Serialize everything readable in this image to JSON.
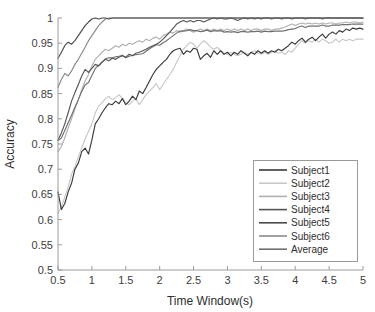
{
  "chart_data": {
    "type": "line",
    "title": "",
    "xlabel": "Time Window(s)",
    "ylabel": "Accuracy",
    "xlim": [
      0.5,
      5
    ],
    "ylim": [
      0.5,
      1
    ],
    "grid": false,
    "legend_position": "lower-right",
    "xticks": [
      "0.5",
      "1",
      "1.5",
      "2",
      "2.5",
      "3",
      "3.5",
      "4",
      "4.5",
      "5"
    ],
    "xtick_values": [
      0.5,
      1,
      1.5,
      2,
      2.5,
      3,
      3.5,
      4,
      4.5,
      5
    ],
    "yticks": [
      "0.5",
      "0.55",
      "0.6",
      "0.65",
      "0.7",
      "0.75",
      "0.8",
      "0.85",
      "0.9",
      "0.95",
      "1"
    ],
    "ytick_values": [
      0.5,
      0.55,
      0.6,
      0.65,
      0.7,
      0.75,
      0.8,
      0.85,
      0.9,
      0.95,
      1
    ],
    "x": [
      0.5,
      0.55,
      0.6,
      0.65,
      0.7,
      0.75,
      0.8,
      0.85,
      0.9,
      0.95,
      1,
      1.05,
      1.1,
      1.15,
      1.2,
      1.25,
      1.3,
      1.35,
      1.4,
      1.45,
      1.5,
      1.55,
      1.6,
      1.65,
      1.7,
      1.75,
      1.8,
      1.85,
      1.9,
      1.95,
      2,
      2.05,
      2.1,
      2.15,
      2.2,
      2.25,
      2.3,
      2.35,
      2.4,
      2.45,
      2.5,
      2.55,
      2.6,
      2.65,
      2.7,
      2.75,
      2.8,
      2.85,
      2.9,
      2.95,
      3,
      3.05,
      3.1,
      3.15,
      3.2,
      3.25,
      3.3,
      3.35,
      3.4,
      3.45,
      3.5,
      3.55,
      3.6,
      3.65,
      3.7,
      3.75,
      3.8,
      3.85,
      3.9,
      3.95,
      4,
      4.05,
      4.1,
      4.15,
      4.2,
      4.25,
      4.3,
      4.35,
      4.4,
      4.45,
      4.5,
      4.55,
      4.6,
      4.65,
      4.7,
      4.75,
      4.8,
      4.85,
      4.9,
      4.95,
      5
    ],
    "series": [
      {
        "name": "Subject1",
        "color": "#3a3a3a",
        "values": [
          0.655,
          0.62,
          0.632,
          0.655,
          0.672,
          0.7,
          0.712,
          0.735,
          0.742,
          0.73,
          0.758,
          0.79,
          0.8,
          0.812,
          0.822,
          0.83,
          0.828,
          0.835,
          0.83,
          0.84,
          0.828,
          0.835,
          0.845,
          0.838,
          0.855,
          0.85,
          0.862,
          0.875,
          0.888,
          0.898,
          0.905,
          0.912,
          0.918,
          0.928,
          0.935,
          0.938,
          0.94,
          0.928,
          0.935,
          0.932,
          0.94,
          0.938,
          0.918,
          0.925,
          0.93,
          0.922,
          0.935,
          0.928,
          0.935,
          0.928,
          0.932,
          0.925,
          0.932,
          0.928,
          0.935,
          0.93,
          0.925,
          0.932,
          0.928,
          0.935,
          0.93,
          0.935,
          0.93,
          0.935,
          0.932,
          0.938,
          0.935,
          0.94,
          0.945,
          0.952,
          0.948,
          0.955,
          0.96,
          0.952,
          0.958,
          0.962,
          0.955,
          0.962,
          0.968,
          0.96,
          0.968,
          0.972,
          0.968,
          0.975,
          0.972,
          0.978,
          0.975,
          0.98,
          0.978,
          0.98,
          0.978
        ]
      },
      {
        "name": "Subject2",
        "color": "#c8c8c8",
        "values": [
          0.612,
          0.625,
          0.645,
          0.665,
          0.69,
          0.705,
          0.725,
          0.742,
          0.76,
          0.775,
          0.79,
          0.812,
          0.825,
          0.832,
          0.84,
          0.845,
          0.838,
          0.842,
          0.848,
          0.84,
          0.832,
          0.828,
          0.835,
          0.84,
          0.828,
          0.838,
          0.848,
          0.855,
          0.862,
          0.87,
          0.858,
          0.868,
          0.878,
          0.888,
          0.898,
          0.912,
          0.925,
          0.938,
          0.945,
          0.952,
          0.948,
          0.94,
          0.948,
          0.955,
          0.95,
          0.942,
          0.938,
          0.942,
          0.935,
          0.93,
          0.928,
          0.932,
          0.928,
          0.925,
          0.928,
          0.932,
          0.928,
          0.932,
          0.935,
          0.93,
          0.928,
          0.932,
          0.928,
          0.932,
          0.935,
          0.93,
          0.932,
          0.928,
          0.935,
          0.932,
          0.94,
          0.948,
          0.955,
          0.95,
          0.955,
          0.952,
          0.958,
          0.952,
          0.958,
          0.955,
          0.95,
          0.952,
          0.958,
          0.952,
          0.958,
          0.955,
          0.958,
          0.955,
          0.958,
          0.958,
          0.958
        ]
      },
      {
        "name": "Subject3",
        "color": "#b0b0b0",
        "values": [
          0.735,
          0.745,
          0.762,
          0.782,
          0.8,
          0.82,
          0.838,
          0.858,
          0.875,
          0.888,
          0.905,
          0.918,
          0.925,
          0.932,
          0.938,
          0.935,
          0.94,
          0.945,
          0.942,
          0.948,
          0.945,
          0.95,
          0.948,
          0.952,
          0.955,
          0.952,
          0.958,
          0.955,
          0.96,
          0.962,
          0.958,
          0.965,
          0.968,
          0.972,
          0.97,
          0.975,
          0.972,
          0.975,
          0.978,
          0.975,
          0.972,
          0.975,
          0.978,
          0.975,
          0.978,
          0.975,
          0.978,
          0.975,
          0.978,
          0.975,
          0.978,
          0.975,
          0.978,
          0.975,
          0.978,
          0.975,
          0.978,
          0.975,
          0.978,
          0.978,
          0.975,
          0.978,
          0.978,
          0.975,
          0.978,
          0.978,
          0.98,
          0.982,
          0.985,
          0.988,
          0.985,
          0.988,
          0.99,
          0.988,
          0.99,
          0.988,
          0.99,
          0.988,
          0.99,
          0.988,
          0.99,
          0.99,
          0.988,
          0.99,
          0.99,
          0.992,
          0.99,
          0.992,
          0.992,
          0.99,
          0.992
        ]
      },
      {
        "name": "Subject4",
        "color": "#555555",
        "values": [
          0.758,
          0.772,
          0.79,
          0.812,
          0.835,
          0.852,
          0.868,
          0.885,
          0.898,
          0.892,
          0.9,
          0.908,
          0.905,
          0.912,
          0.918,
          0.915,
          0.92,
          0.918,
          0.922,
          0.925,
          0.922,
          0.928,
          0.925,
          0.93,
          0.932,
          0.935,
          0.938,
          0.942,
          0.945,
          0.948,
          0.952,
          0.958,
          0.965,
          0.972,
          0.98,
          0.988,
          0.992,
          0.995,
          0.992,
          0.995,
          0.992,
          0.995,
          0.995,
          0.992,
          0.995,
          0.998,
          1.0,
          0.998,
          1.0,
          0.998,
          0.998,
          1.0,
          0.998,
          0.995,
          0.998,
          1.0,
          0.998,
          1.0,
          0.998,
          1.0,
          0.998,
          1.0,
          1.0,
          0.998,
          1.0,
          1.0,
          0.998,
          1.0,
          1.0,
          0.998,
          1.0,
          1.0,
          1.0,
          0.998,
          1.0,
          1.0,
          1.0,
          1.0,
          0.998,
          1.0,
          1.0,
          1.0,
          1.0,
          1.0,
          1.0,
          1.0,
          1.0,
          1.0,
          1.0,
          1.0,
          1.0
        ]
      },
      {
        "name": "Subject5",
        "color": "#4a4a4a",
        "values": [
          0.92,
          0.932,
          0.945,
          0.952,
          0.948,
          0.955,
          0.965,
          0.975,
          0.985,
          0.992,
          0.998,
          1.0,
          0.998,
          1.0,
          1.0,
          0.998,
          1.0,
          1.0,
          1.0,
          1.0,
          1.0,
          1.0,
          1.0,
          1.0,
          1.0,
          1.0,
          1.0,
          1.0,
          1.0,
          1.0,
          1.0,
          1.0,
          1.0,
          1.0,
          1.0,
          1.0,
          1.0,
          1.0,
          1.0,
          1.0,
          1.0,
          1.0,
          1.0,
          1.0,
          1.0,
          1.0,
          1.0,
          1.0,
          1.0,
          1.0,
          1.0,
          1.0,
          1.0,
          1.0,
          1.0,
          1.0,
          1.0,
          1.0,
          1.0,
          1.0,
          1.0,
          1.0,
          1.0,
          1.0,
          1.0,
          1.0,
          1.0,
          1.0,
          1.0,
          1.0,
          1.0,
          1.0,
          1.0,
          1.0,
          1.0,
          1.0,
          1.0,
          1.0,
          1.0,
          1.0,
          1.0,
          1.0,
          1.0,
          1.0,
          1.0,
          1.0,
          1.0,
          1.0,
          1.0,
          1.0,
          1.0
        ]
      },
      {
        "name": "Subject6",
        "color": "#8a8a8a",
        "values": [
          0.862,
          0.878,
          0.89,
          0.885,
          0.895,
          0.908,
          0.918,
          0.93,
          0.942,
          0.955,
          0.965,
          0.975,
          0.985,
          0.992,
          0.998,
          1.0,
          1.0,
          1.0,
          1.0,
          1.0,
          1.0,
          1.0,
          1.0,
          1.0,
          1.0,
          1.0,
          1.0,
          1.0,
          1.0,
          1.0,
          1.0,
          1.0,
          1.0,
          1.0,
          1.0,
          1.0,
          1.0,
          1.0,
          1.0,
          1.0,
          1.0,
          1.0,
          1.0,
          1.0,
          1.0,
          1.0,
          1.0,
          1.0,
          1.0,
          1.0,
          1.0,
          1.0,
          1.0,
          1.0,
          1.0,
          1.0,
          1.0,
          1.0,
          1.0,
          1.0,
          1.0,
          1.0,
          1.0,
          1.0,
          1.0,
          1.0,
          1.0,
          1.0,
          1.0,
          1.0,
          1.0,
          1.0,
          1.0,
          1.0,
          1.0,
          1.0,
          1.0,
          1.0,
          1.0,
          1.0,
          1.0,
          1.0,
          1.0,
          1.0,
          1.0,
          1.0,
          1.0,
          1.0,
          1.0,
          1.0,
          1.0
        ]
      },
      {
        "name": "Average",
        "color": "#707070",
        "values": [
          0.757,
          0.762,
          0.777,
          0.792,
          0.807,
          0.823,
          0.838,
          0.854,
          0.867,
          0.872,
          0.886,
          0.9,
          0.906,
          0.913,
          0.919,
          0.921,
          0.921,
          0.923,
          0.924,
          0.926,
          0.921,
          0.924,
          0.926,
          0.927,
          0.928,
          0.929,
          0.934,
          0.939,
          0.943,
          0.947,
          0.946,
          0.951,
          0.955,
          0.96,
          0.965,
          0.97,
          0.974,
          0.974,
          0.975,
          0.977,
          0.975,
          0.975,
          0.973,
          0.974,
          0.976,
          0.973,
          0.975,
          0.974,
          0.975,
          0.972,
          0.973,
          0.972,
          0.973,
          0.971,
          0.973,
          0.973,
          0.972,
          0.973,
          0.973,
          0.974,
          0.972,
          0.974,
          0.973,
          0.973,
          0.974,
          0.974,
          0.974,
          0.975,
          0.977,
          0.978,
          0.979,
          0.982,
          0.984,
          0.981,
          0.984,
          0.984,
          0.984,
          0.984,
          0.986,
          0.984,
          0.984,
          0.986,
          0.986,
          0.986,
          0.987,
          0.987,
          0.987,
          0.988,
          0.988,
          0.988,
          0.988
        ]
      }
    ]
  },
  "legend": {
    "items": [
      {
        "label": "Subject1"
      },
      {
        "label": "Subject2"
      },
      {
        "label": "Subject3"
      },
      {
        "label": "Subject4"
      },
      {
        "label": "Subject5"
      },
      {
        "label": "Subject6"
      },
      {
        "label": "Average"
      }
    ]
  }
}
